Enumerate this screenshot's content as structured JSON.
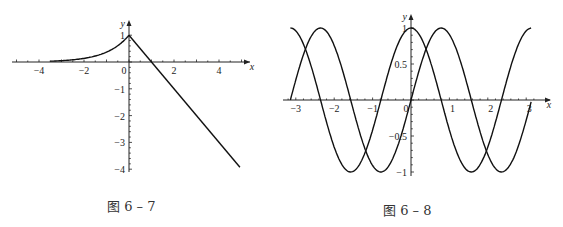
{
  "chart_data": [
    {
      "type": "line",
      "caption": "图 6 – 7",
      "title": "",
      "xlabel": "x",
      "ylabel": "y",
      "xlim": [
        -5,
        5.5
      ],
      "ylim": [
        -4,
        1.2
      ],
      "x_ticks": [
        -4,
        -2,
        0,
        2,
        4
      ],
      "y_ticks": [
        1,
        -1,
        -2,
        -3,
        -4
      ],
      "x_tick_labels": [
        "-4",
        "-2",
        "0",
        "2",
        "4"
      ],
      "y_tick_labels": [
        "1",
        "-1",
        "-2",
        "-3",
        "-4"
      ],
      "grid": false,
      "series": [
        {
          "name": "y = e^x (x ≤ 0)",
          "x": [
            -3.5,
            -3,
            -2.5,
            -2,
            -1.5,
            -1,
            -0.5,
            0
          ],
          "values": [
            0.03,
            0.05,
            0.08,
            0.14,
            0.22,
            0.37,
            0.61,
            1.0
          ]
        },
        {
          "name": "y = 1 − x (x ≥ 0)",
          "x": [
            0,
            1,
            2,
            3,
            4,
            4.9
          ],
          "values": [
            1,
            0,
            -1,
            -2,
            -3,
            -3.9
          ]
        }
      ]
    },
    {
      "type": "line",
      "caption": "图 6 – 8",
      "title": "",
      "xlabel": "x",
      "ylabel": "y",
      "xlim": [
        -3.14,
        3.14
      ],
      "ylim": [
        -1,
        1
      ],
      "x_ticks": [
        -3,
        -2,
        -1,
        0,
        1,
        2,
        3
      ],
      "y_ticks": [
        1,
        0.5,
        -0.5,
        -1
      ],
      "x_tick_labels": [
        "-3",
        "-2",
        "-1",
        "0",
        "1",
        "2",
        "3"
      ],
      "y_tick_labels": [
        "1",
        "0.5",
        "-0.5",
        "-1"
      ],
      "grid": false,
      "series": [
        {
          "name": "y = cos 2x",
          "x": [
            -3.14,
            -2.36,
            -1.57,
            -0.79,
            0,
            0.79,
            1.57,
            2.36,
            3.14
          ],
          "values": [
            1,
            0,
            -1,
            0,
            1,
            0,
            -1,
            0,
            1
          ]
        },
        {
          "name": "y = sin 2x",
          "x": [
            -3.14,
            -2.36,
            -1.57,
            -0.79,
            0,
            0.79,
            1.57,
            2.36,
            3.14
          ],
          "values": [
            0,
            1,
            0,
            -1,
            0,
            1,
            0,
            -1,
            0
          ]
        }
      ]
    }
  ],
  "figures": {
    "left": {
      "caption": "图 6 – 7",
      "x_label": "x",
      "y_label": "y",
      "xticks": [
        "-4",
        "-2",
        "0",
        "2",
        "4"
      ],
      "yticks": [
        "1",
        "-1",
        "-2",
        "-3",
        "-4"
      ]
    },
    "right": {
      "caption": "图 6 – 8",
      "x_label": "x",
      "y_label": "y",
      "xticks": [
        "-3",
        "-2",
        "-1",
        "0",
        "1",
        "2",
        "3"
      ],
      "yticks": [
        "1",
        "0.5",
        "-0.5",
        "-1"
      ]
    }
  }
}
